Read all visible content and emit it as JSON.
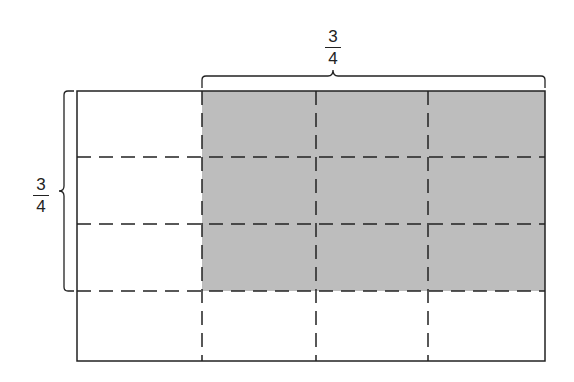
{
  "diagram": {
    "grid": {
      "columns": 4,
      "rows": 4
    },
    "shaded": {
      "columns": [
        2,
        3,
        4
      ],
      "rows": [
        1,
        2,
        3
      ],
      "color": "#bdbdbd"
    },
    "top_label": {
      "numerator": "3",
      "denominator": "4"
    },
    "left_label": {
      "numerator": "3",
      "denominator": "4"
    },
    "colors": {
      "line": "#222222",
      "shade": "#bdbdbd",
      "background": "#ffffff"
    }
  }
}
